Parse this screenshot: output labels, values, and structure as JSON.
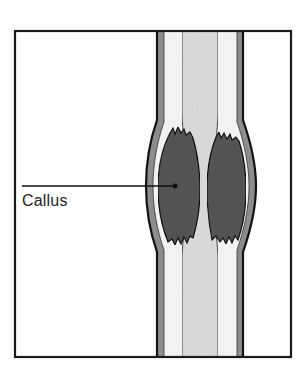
{
  "figure": {
    "labels": [
      {
        "id": "callus",
        "text": "Callus"
      }
    ]
  },
  "colors": {
    "frame": "#1a1a1a",
    "periosteum": "#8c8c8c",
    "cortex": "#f2f2f2",
    "medulla": "#dcdcdc",
    "callus": "#555555",
    "outline": "#111111",
    "background": "#ffffff"
  }
}
